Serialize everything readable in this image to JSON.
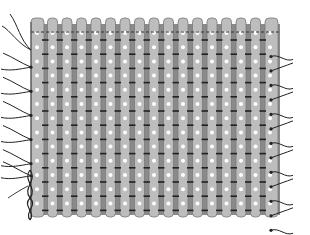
{
  "figure": {
    "colors": {
      "background": "#ffffff",
      "strip_fill": "#bdbdbd",
      "strip_edge": "#7a7a7a",
      "gap_fill": "#8a8a8a",
      "bar": "#222222",
      "dot": "#ffffff",
      "thread": "#222222",
      "dashed_line": "#333333"
    },
    "panel": {
      "left": 31,
      "right": 280,
      "top": 18,
      "bottom": 217
    },
    "columns": 17,
    "column_pitch": 14.5,
    "rows": 14,
    "row_start_y": 33,
    "row_pitch": 14.2,
    "dashed_line_y": 32,
    "left_thread_rows": [
      2,
      4,
      6,
      8,
      10,
      11
    ],
    "right_thread_rows": [
      1,
      2,
      3,
      4,
      5,
      6,
      7,
      8,
      9,
      10,
      11,
      12,
      13
    ]
  }
}
